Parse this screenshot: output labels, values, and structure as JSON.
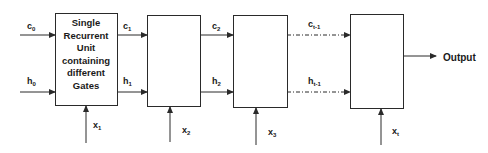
{
  "diagram": {
    "first_unit_text": [
      "Single",
      "Recurrent",
      "Unit",
      "containing",
      "different",
      "Gates"
    ],
    "output_label": "Output",
    "cell_inputs": [
      {
        "base": "c",
        "sub": "0"
      },
      {
        "base": "c",
        "sub": "1"
      },
      {
        "base": "c",
        "sub": "2"
      },
      {
        "base": "c",
        "sub": "t-1"
      }
    ],
    "hidden_inputs": [
      {
        "base": "h",
        "sub": "0"
      },
      {
        "base": "h",
        "sub": "1"
      },
      {
        "base": "h",
        "sub": "2"
      },
      {
        "base": "h",
        "sub": "t-1"
      }
    ],
    "x_inputs": [
      {
        "base": "x",
        "sub": "1"
      },
      {
        "base": "x",
        "sub": "2"
      },
      {
        "base": "x",
        "sub": "3"
      },
      {
        "base": "x",
        "sub": "t"
      }
    ],
    "colors": {
      "line": "#2a2a2a",
      "background": "#ffffff"
    }
  }
}
